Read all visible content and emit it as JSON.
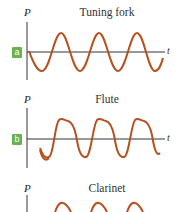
{
  "colors": {
    "wave": "#b5511f",
    "axis": "#333333",
    "badge": "#6ab04c"
  },
  "panels": [
    {
      "badge": "a",
      "title": "Tuning fork",
      "y_axis_label": "P",
      "x_axis_label": "t",
      "waveform": "pure sine"
    },
    {
      "badge": "b",
      "title": "Flute",
      "y_axis_label": "P",
      "x_axis_label": "t",
      "waveform": "sine with harmonic shoulders"
    },
    {
      "badge": "c",
      "title": "Clarinet",
      "y_axis_label": "P",
      "x_axis_label": "t",
      "waveform": "complex with harmonics"
    }
  ]
}
